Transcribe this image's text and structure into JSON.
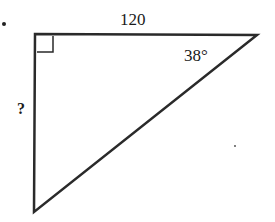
{
  "diagram": {
    "type": "right-triangle",
    "labels": {
      "top_side": "120",
      "angle": "38°",
      "left_side": "?"
    },
    "right_angle_marker": true,
    "colors": {
      "stroke": "#2a2a2a",
      "background": "#ffffff"
    }
  }
}
